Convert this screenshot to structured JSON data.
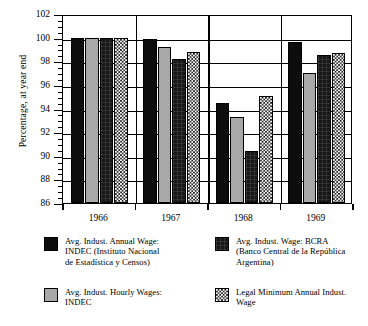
{
  "chart_data": {
    "type": "bar",
    "title": "",
    "xlabel": "",
    "ylabel": "Percentage, at year end",
    "categories": [
      "1966",
      "1967",
      "1968",
      "1969"
    ],
    "ylim": [
      86,
      102
    ],
    "ytick_step": 2,
    "yticks": [
      86,
      88,
      90,
      92,
      94,
      96,
      98,
      100,
      102
    ],
    "grid": true,
    "legend_position": "bottom",
    "series": [
      {
        "name": "Avg. Indust. Annual Wage: INDEC (Instituto Nacional de Estadística y Censos)",
        "pattern": "solid-black",
        "color": "#0d0d0d",
        "values": [
          100.0,
          99.9,
          94.5,
          99.6
        ]
      },
      {
        "name": "Avg. Indust. Hourly Wages: INDEC",
        "pattern": "solid-gray",
        "color": "#a8a8a8",
        "values": [
          100.0,
          99.2,
          93.3,
          97.0
        ]
      },
      {
        "name": "Avg. Indust. Wage: BCRA (Banco Central de la República Argentina)",
        "pattern": "dark-textured",
        "color": "#171717",
        "values": [
          100.0,
          98.2,
          90.4,
          98.5
        ]
      },
      {
        "name": "Legal Minimum Annual Indust. Wage",
        "pattern": "checkerboard",
        "color": "#151515",
        "values": [
          100.0,
          98.75,
          95.1,
          98.7
        ]
      }
    ]
  },
  "axis": {
    "y_title": "Percentage, at year end",
    "y_labels": [
      "102",
      "100",
      "98",
      "96",
      "94",
      "92",
      "90",
      "88",
      "86"
    ],
    "x_labels": [
      "1966",
      "1967",
      "1968",
      "1969"
    ]
  },
  "legend": {
    "items": [
      {
        "swatch": "solid-black",
        "label": "Avg. Indust. Annual Wage:\nINDEC (Instituto Nacional\nde Estadística y Censos)"
      },
      {
        "swatch": "dark-textured",
        "label": "Avg. Indust. Wage: BCRA\n(Banco Central de la República\nArgentina)"
      },
      {
        "swatch": "solid-gray",
        "label": "Avg. Indust. Hourly Wages:\nINDEC"
      },
      {
        "swatch": "checkerboard",
        "label": "Legal Minimum Annual Indust.\nWage"
      }
    ]
  }
}
